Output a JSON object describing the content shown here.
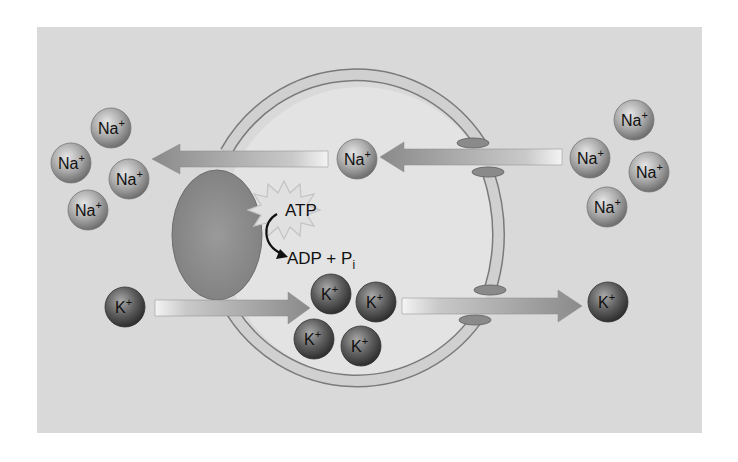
{
  "diagram": {
    "colors": {
      "page_bg": "#ffffff",
      "panel_bg": "#d9d9d9",
      "cell_interior": "#e3e3e3",
      "membrane_fill": "#cfcfcf",
      "membrane_stroke": "#7a7a7a",
      "channel_cap": "#8a8a8a",
      "pump": "#8e8e8e",
      "arrow_dark": "#8a8a8a",
      "arrow_light": "#f2f2f2",
      "na_ion": "#a8a8a8",
      "k_ion": "#5e5e5e",
      "starburst": "#cfcfcf"
    },
    "labels": {
      "atp": "ATP",
      "adp": "ADP + P",
      "adp_subscript": "i"
    },
    "ions": {
      "na_outside_left": [
        {
          "label": "Na",
          "charge": "+",
          "cx": 111,
          "cy": 128
        },
        {
          "label": "Na",
          "charge": "+",
          "cx": 71,
          "cy": 163
        },
        {
          "label": "Na",
          "charge": "+",
          "cx": 129,
          "cy": 179
        },
        {
          "label": "Na",
          "charge": "+",
          "cx": 88,
          "cy": 210
        }
      ],
      "na_inside": [
        {
          "label": "Na",
          "charge": "+",
          "cx": 357,
          "cy": 159
        }
      ],
      "na_outside_right": [
        {
          "label": "Na",
          "charge": "+",
          "cx": 634,
          "cy": 120
        },
        {
          "label": "Na",
          "charge": "+",
          "cx": 590,
          "cy": 158
        },
        {
          "label": "Na",
          "charge": "+",
          "cx": 649,
          "cy": 172
        },
        {
          "label": "Na",
          "charge": "+",
          "cx": 607,
          "cy": 207
        }
      ],
      "k_outside_left": [
        {
          "label": "K",
          "charge": "+",
          "cx": 125,
          "cy": 307
        }
      ],
      "k_inside": [
        {
          "label": "K",
          "charge": "+",
          "cx": 331,
          "cy": 294
        },
        {
          "label": "K",
          "charge": "+",
          "cx": 376,
          "cy": 302
        },
        {
          "label": "K",
          "charge": "+",
          "cx": 314,
          "cy": 339
        },
        {
          "label": "K",
          "charge": "+",
          "cx": 361,
          "cy": 346
        }
      ],
      "k_outside_right": [
        {
          "label": "K",
          "charge": "+",
          "cx": 608,
          "cy": 302
        }
      ]
    },
    "arrows": [
      {
        "name": "na-pump-out-arrow",
        "direction": "left",
        "from_x": 328,
        "to_x": 152,
        "y": 159
      },
      {
        "name": "na-leak-in-arrow",
        "direction": "left",
        "from_x": 562,
        "to_x": 380,
        "y": 157
      },
      {
        "name": "k-pump-in-arrow",
        "direction": "right",
        "from_x": 155,
        "to_x": 310,
        "y": 308
      },
      {
        "name": "k-leak-out-arrow",
        "direction": "right",
        "from_x": 402,
        "to_x": 582,
        "y": 306
      }
    ]
  }
}
